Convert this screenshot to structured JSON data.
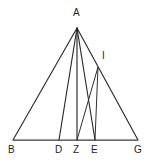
{
  "figure": {
    "background_color": "#ffffff",
    "stroke_color": "#2b2b2b",
    "label_color": "#1e1e1e",
    "width": 154,
    "height": 162
  },
  "points": [
    {
      "id": "A",
      "label": "A",
      "x": 77,
      "y": 28,
      "label_x": 73,
      "label_y": 8
    },
    {
      "id": "I",
      "label": "I",
      "x": 98,
      "y": 67,
      "label_x": 102,
      "label_y": 51
    },
    {
      "id": "B",
      "label": "B",
      "x": 13,
      "y": 140,
      "label_x": 8,
      "label_y": 145
    },
    {
      "id": "D",
      "label": "D",
      "x": 59,
      "y": 140,
      "label_x": 55,
      "label_y": 145
    },
    {
      "id": "Z",
      "label": "Z",
      "x": 77,
      "y": 140,
      "label_x": 73,
      "label_y": 145
    },
    {
      "id": "E",
      "label": "E",
      "x": 95,
      "y": 140,
      "label_x": 91,
      "label_y": 145
    },
    {
      "id": "G",
      "label": "G",
      "x": 138,
      "y": 140,
      "label_x": 134,
      "label_y": 145
    }
  ],
  "segments": [
    {
      "id": "AB",
      "name": "segment-ab",
      "from": "A",
      "to": "B",
      "style": "seg"
    },
    {
      "id": "AG",
      "name": "segment-ag",
      "from": "A",
      "to": "G",
      "style": "seg"
    },
    {
      "id": "BG",
      "name": "segment-bg-baseline",
      "from": "B",
      "to": "G",
      "style": "seg-base"
    },
    {
      "id": "AD",
      "name": "segment-ad",
      "from": "A",
      "to": "D",
      "style": "seg"
    },
    {
      "id": "AZ",
      "name": "segment-az",
      "from": "A",
      "to": "Z",
      "style": "seg"
    },
    {
      "id": "AE",
      "name": "segment-ae",
      "from": "A",
      "to": "E",
      "style": "seg"
    },
    {
      "id": "ZI",
      "name": "segment-zi",
      "from": "Z",
      "to": "I",
      "style": "seg-thin"
    },
    {
      "id": "IE",
      "name": "segment-ie",
      "from": "I",
      "to": "E",
      "style": "seg-thin"
    }
  ]
}
